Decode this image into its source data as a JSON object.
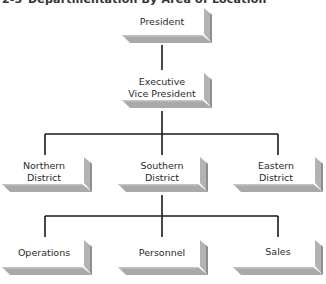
{
  "title": {
    "figure_number": "2-5",
    "text": "Departmentation By Area of Location"
  },
  "colors": {
    "line": "#1a1a1a",
    "shelf": "#a9a9a9",
    "shelf_edge": "#8e8e8e",
    "side": "#b3b3b3",
    "face": "#ffffff",
    "text": "#2a2a2a"
  },
  "nodes": {
    "president": {
      "line1": "President",
      "line2": ""
    },
    "evp": {
      "line1": "Executive",
      "line2": "Vice President"
    },
    "northern": {
      "line1": "Northern",
      "line2": "District"
    },
    "southern": {
      "line1": "Southern",
      "line2": "District"
    },
    "eastern": {
      "line1": "Eastern",
      "line2": "District"
    },
    "operations": {
      "line1": "Operations",
      "line2": ""
    },
    "personnel": {
      "line1": "Personnel",
      "line2": ""
    },
    "sales": {
      "line1": "Sales",
      "line2": ""
    }
  },
  "hierarchy": [
    {
      "parent": "President",
      "children": [
        "Executive Vice President"
      ]
    },
    {
      "parent": "Executive Vice President",
      "children": [
        "Northern District",
        "Southern District",
        "Eastern District"
      ]
    },
    {
      "parent": "Southern District",
      "children": [
        "Operations",
        "Personnel",
        "Sales"
      ]
    }
  ]
}
